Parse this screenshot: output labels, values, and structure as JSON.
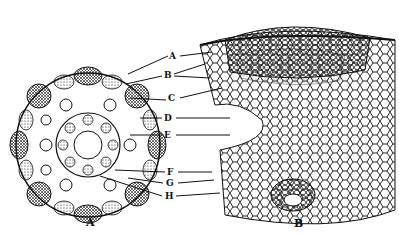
{
  "figure": {
    "panels": [
      {
        "id": "A",
        "caption": "A",
        "description": "transverse section of stem (whole)"
      },
      {
        "id": "B",
        "caption": "B",
        "description": "enlarged sector of section"
      }
    ],
    "labels": [
      {
        "letter": "A"
      },
      {
        "letter": "B"
      },
      {
        "letter": "C"
      },
      {
        "letter": "D"
      },
      {
        "letter": "E"
      },
      {
        "letter": "F"
      },
      {
        "letter": "G"
      },
      {
        "letter": "H"
      }
    ],
    "colors": {
      "ink": "#111111",
      "paper": "#ffffff"
    }
  }
}
